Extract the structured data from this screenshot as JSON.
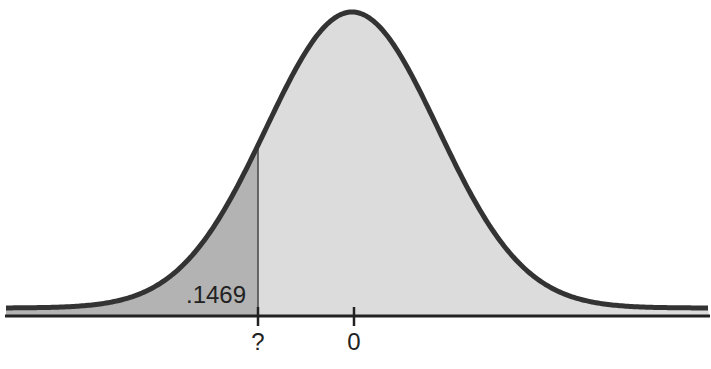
{
  "chart_data": {
    "type": "area",
    "title": "",
    "xlabel": "",
    "ylabel": "",
    "distribution": "standard normal curve",
    "shaded_region": {
      "from": "-inf",
      "to": "?",
      "area_label": ".1469",
      "color": "#b5b5b5"
    },
    "unshaded_fill": "#dcdcdc",
    "curve_color": "#333333",
    "x_ticks": [
      {
        "label": "?",
        "z": -1.05
      },
      {
        "label": "0",
        "z": 0
      }
    ],
    "grid": false,
    "legend": null
  },
  "labels": {
    "area": ".1469",
    "tick_unknown": "?",
    "tick_zero": "0"
  }
}
